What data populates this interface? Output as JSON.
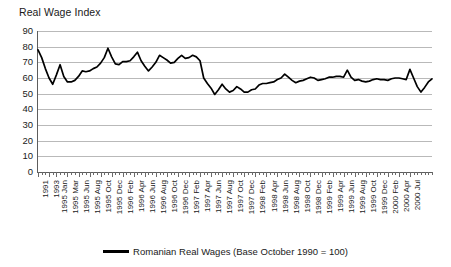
{
  "chart_data": {
    "type": "line",
    "title": "Real Wage Index",
    "xlabel": "",
    "ylabel": "Real Wage Index",
    "ylim": [
      0,
      90
    ],
    "yticks": [
      0,
      10,
      20,
      30,
      40,
      50,
      60,
      70,
      80,
      90
    ],
    "grid": true,
    "legend_position": "bottom",
    "legend": [
      "Romanian Real Wages (Base October 1990 = 100)"
    ],
    "series_color": "#000000",
    "tick_labels": [
      "1991",
      "1993",
      "1995 Jan",
      "1995 Mar",
      "1995 Jun",
      "1995 Aug",
      "1995 Oct",
      "1995 Dec",
      "1996 Feb",
      "1996 Apr",
      "1996 Jun",
      "1996 Aug",
      "1996 Oct",
      "1996 Dec",
      "1997 Feb",
      "1997 Apr",
      "1997 Jun",
      "1997 Aug",
      "1997 Oct",
      "1997 Dec",
      "1998 Feb",
      "1998 Apr",
      "1998 Jun",
      "1998 Aug",
      "1998 Oct",
      "1998 Dec",
      "1999 Feb",
      "1999 Apr",
      "1999 Jun",
      "1999 Aug",
      "1999 Oct",
      "1999 Dec",
      "2000 Feb",
      "2000 Apr",
      "2000 Jul"
    ],
    "series": [
      {
        "name": "Romanian Real Wages (Base October 1990 = 100)",
        "values": [
          78,
          73,
          66,
          60,
          56,
          62,
          68.5,
          61,
          57.5,
          57.5,
          58.5,
          61,
          64.5,
          64,
          64.5,
          66,
          67,
          69.5,
          73,
          79,
          73.5,
          69,
          68.5,
          70.5,
          70.5,
          71,
          73.5,
          76.5,
          71,
          67.5,
          64.5,
          67,
          70,
          74.5,
          73,
          71.5,
          69.5,
          70,
          72.5,
          74.5,
          72.5,
          73,
          74.5,
          73.5,
          71,
          60,
          56.5,
          53.5,
          49.5,
          52.5,
          56,
          53,
          51,
          52,
          54.5,
          53,
          51,
          51,
          52.5,
          53,
          55.5,
          56.5,
          56.5,
          57,
          57.5,
          59,
          60,
          62.5,
          60.5,
          58.5,
          57,
          58,
          58.5,
          59.5,
          60.5,
          60,
          58.5,
          59,
          59.5,
          60.5,
          60.5,
          61,
          61,
          60.5,
          65,
          60.5,
          58.5,
          59,
          58,
          57.5,
          58,
          59,
          59.5,
          59,
          59,
          58.5,
          59.5,
          60,
          60,
          59.5,
          59,
          65.5,
          60,
          54.5,
          51,
          54,
          57.5,
          59.5
        ]
      }
    ]
  }
}
